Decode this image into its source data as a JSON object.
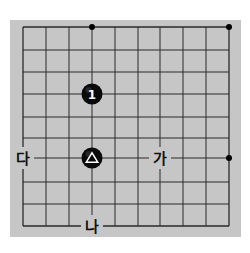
{
  "board": {
    "background_color": "#ffffff",
    "board_color": "#c6c6c6",
    "line_color": "#2a2a2a",
    "board_rect": {
      "x": 10,
      "y": 20,
      "width": 231,
      "height": 217
    },
    "columns_x": [
      23,
      46,
      69,
      92,
      115,
      138,
      160,
      183,
      206,
      229
    ],
    "rows_y": [
      27,
      50,
      72,
      94,
      117,
      138,
      158,
      182,
      204,
      226
    ],
    "star_points": [
      {
        "x": 92,
        "y": 27
      },
      {
        "x": 229,
        "y": 27
      },
      {
        "x": 229,
        "y": 158
      }
    ]
  },
  "stones": [
    {
      "color": "black",
      "x": 92,
      "y": 94,
      "marker": "number",
      "label": "1"
    },
    {
      "color": "black",
      "x": 92,
      "y": 158,
      "marker": "triangle",
      "label": "△"
    }
  ],
  "labels": [
    {
      "text": "가",
      "x": 160,
      "y": 158
    },
    {
      "text": "나",
      "x": 92,
      "y": 226
    },
    {
      "text": "다",
      "x": 23,
      "y": 158
    }
  ]
}
